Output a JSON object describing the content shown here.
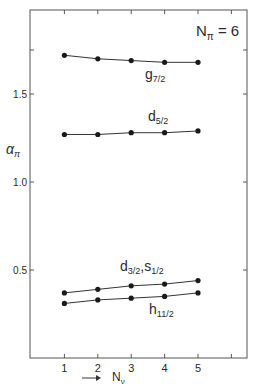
{
  "chart_data": {
    "type": "line",
    "title": "",
    "annotation": "N_π = 6",
    "annotation_parts": {
      "base": "N",
      "sub": "π",
      "rest": " = 6"
    },
    "xlabel": "N_ν",
    "xlabel_parts": {
      "arrow": "→",
      "base": "N",
      "sub": "ν"
    },
    "ylabel": "α_π",
    "ylabel_parts": {
      "base": "α",
      "sub": "π"
    },
    "x": [
      1,
      2,
      3,
      4,
      5
    ],
    "x_ticks": [
      1,
      2,
      3,
      4,
      5,
      6
    ],
    "x_tick_labels": [
      "1",
      "2",
      "3",
      "4",
      "5",
      ""
    ],
    "y_ticks": [
      0.5,
      1.0,
      1.5,
      1.75
    ],
    "y_tick_labels": [
      "0.5",
      "1.0",
      "1.5",
      ""
    ],
    "xlim": [
      0,
      6.5
    ],
    "ylim": [
      0,
      1.98
    ],
    "grid": false,
    "legend": "inline labels next to each curve",
    "series": [
      {
        "name": "g7/2",
        "label_base": "g",
        "label_sub": "7/2",
        "values": [
          1.72,
          1.7,
          1.69,
          1.68,
          1.68
        ]
      },
      {
        "name": "d5/2",
        "label_base": "d",
        "label_sub": "5/2",
        "values": [
          1.27,
          1.27,
          1.28,
          1.28,
          1.29
        ]
      },
      {
        "name": "d3/2, s1/2",
        "label_base": "d",
        "label_sub": "3/2",
        "label_base2": ",s",
        "label_sub2": "1/2",
        "values": [
          0.37,
          0.39,
          0.41,
          0.42,
          0.44
        ]
      },
      {
        "name": "h11/2",
        "label_base": "h",
        "label_sub": "11/2",
        "values": [
          0.31,
          0.33,
          0.34,
          0.35,
          0.37
        ]
      }
    ]
  }
}
